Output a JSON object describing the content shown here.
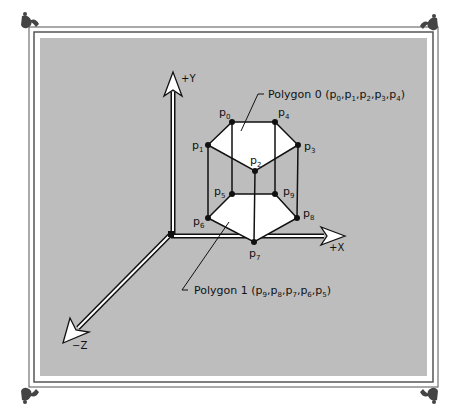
{
  "figure": {
    "frame_fill": "#bdbdbd",
    "frame_line": "#555555",
    "polygon_fill": "#ffffff",
    "axes": {
      "y": {
        "label": "+Y"
      },
      "x": {
        "label": "+X"
      },
      "z": {
        "label": "−Z"
      }
    },
    "vertices": [
      {
        "id": "p0",
        "base": "p",
        "sub": "0"
      },
      {
        "id": "p1",
        "base": "p",
        "sub": "1"
      },
      {
        "id": "p2",
        "base": "p",
        "sub": "2"
      },
      {
        "id": "p3",
        "base": "p",
        "sub": "3"
      },
      {
        "id": "p4",
        "base": "p",
        "sub": "4"
      },
      {
        "id": "p5",
        "base": "p",
        "sub": "5"
      },
      {
        "id": "p6",
        "base": "p",
        "sub": "6"
      },
      {
        "id": "p7",
        "base": "p",
        "sub": "7"
      },
      {
        "id": "p8",
        "base": "p",
        "sub": "8"
      },
      {
        "id": "p9",
        "base": "p",
        "sub": "9"
      }
    ],
    "callouts": {
      "polygon0": {
        "prefix": "Polygon 0 (",
        "items": [
          {
            "base": "p",
            "sub": "0"
          },
          {
            "base": "p",
            "sub": "1"
          },
          {
            "base": "p",
            "sub": "2"
          },
          {
            "base": "p",
            "sub": "3"
          },
          {
            "base": "p",
            "sub": "4"
          }
        ],
        "suffix": ")"
      },
      "polygon1": {
        "prefix": "Polygon 1 (",
        "items": [
          {
            "base": "p",
            "sub": "9"
          },
          {
            "base": "p",
            "sub": "8"
          },
          {
            "base": "p",
            "sub": "7"
          },
          {
            "base": "p",
            "sub": "6"
          },
          {
            "base": "p",
            "sub": "5"
          }
        ],
        "suffix": ")"
      }
    },
    "separator": ","
  }
}
